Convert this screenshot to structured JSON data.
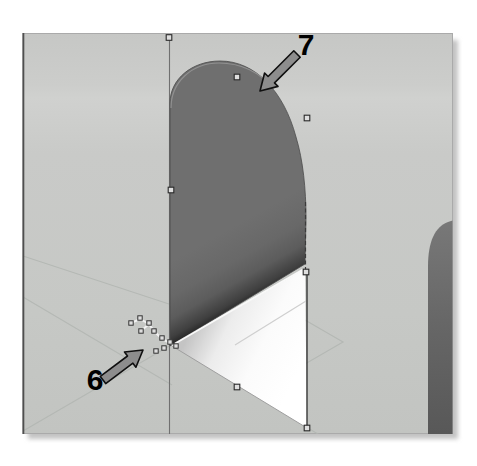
{
  "annotations": {
    "callout_7": {
      "label": "7"
    },
    "callout_6": {
      "label": "6"
    }
  },
  "colors": {
    "page_background": "#ffffff",
    "viewport_background": "#c8c9c7",
    "viewport_border": "#a9a9a9",
    "viewport_left_edge": "#4f4f4f",
    "surface_dark_gray": "#6b6b6b",
    "surface_edge_shadow": "#2a2a2a",
    "floor_highlight_white": "#ffffff",
    "grid_line_gray": "#b2b6b2",
    "sketch_line_white": "#f2f2f2",
    "edge_black": "#2d2d2d",
    "handle_fill": "#dedede",
    "handle_border": "#2a2a2a",
    "arrow_fill": "#8d8d8d",
    "arrow_outline": "#101010",
    "label_black": "#000000"
  }
}
